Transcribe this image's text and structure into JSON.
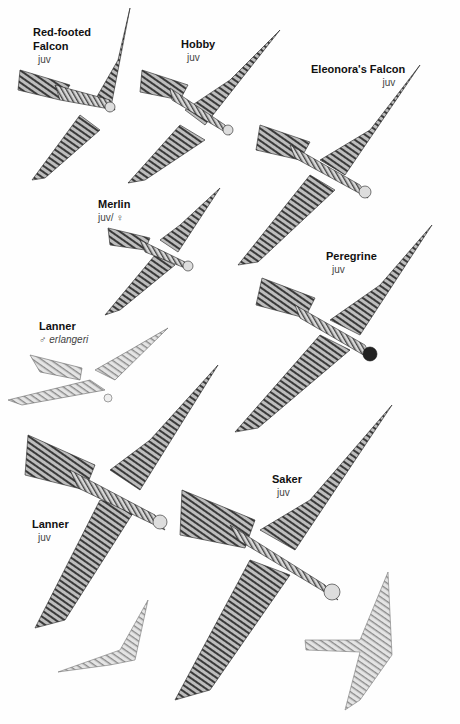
{
  "plate": {
    "subject": "Falcons in flight, underside views",
    "background": "#ffffff",
    "ink_color": "#2a2a2a"
  },
  "labels": [
    {
      "id": "red-footed-falcon",
      "name_line1": "Red-footed",
      "name_line2": "Falcon",
      "age": "juv"
    },
    {
      "id": "hobby",
      "name": "Hobby",
      "age": "juv"
    },
    {
      "id": "eleonoras-falcon",
      "name": "Eleonora's Falcon",
      "age": "juv"
    },
    {
      "id": "merlin",
      "name": "Merlin",
      "age": "juv/ ♀"
    },
    {
      "id": "peregrine",
      "name": "Peregrine",
      "age": "juv"
    },
    {
      "id": "lanner-erlangeri",
      "name": "Lanner",
      "age": "♂ erlangeri"
    },
    {
      "id": "lanner-juv",
      "name": "Lanner",
      "age": "juv"
    },
    {
      "id": "saker",
      "name": "Saker",
      "age": "juv"
    }
  ]
}
